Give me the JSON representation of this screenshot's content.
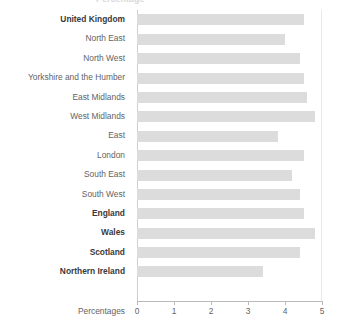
{
  "title_clipped": "Percentage",
  "axis_title": "Percentages",
  "chart_data": {
    "type": "bar",
    "orientation": "horizontal",
    "title": "",
    "xlabel": "Percentages",
    "ylabel": "",
    "xlim": [
      0,
      5
    ],
    "xticks": [
      "0",
      "1",
      "2",
      "3",
      "4",
      "5"
    ],
    "grid": true,
    "legend": "none",
    "bar_color": "#dcdcdc",
    "categories": [
      "United Kingdom",
      "North East",
      "North West",
      "Yorkshire and the Humber",
      "East Midlands",
      "West Midlands",
      "East",
      "London",
      "South East",
      "South West",
      "England",
      "Wales",
      "Scotland",
      "Northern Ireland"
    ],
    "values": [
      4.5,
      4.0,
      4.4,
      4.5,
      4.6,
      4.8,
      3.8,
      4.5,
      4.2,
      4.4,
      4.5,
      4.8,
      4.4,
      3.4
    ],
    "emphasis": [
      true,
      false,
      false,
      false,
      false,
      false,
      false,
      false,
      false,
      false,
      true,
      true,
      true,
      true
    ]
  }
}
